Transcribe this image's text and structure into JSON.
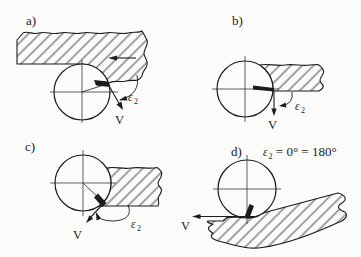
{
  "figure": {
    "colors": {
      "ink": "#1c1c1c",
      "background": "#fbfbf9"
    },
    "panels": {
      "a": {
        "label": "a)",
        "v_label": "V",
        "eps": "ε",
        "eps_sub": "2"
      },
      "b": {
        "label": "b)",
        "v_label": "V",
        "eps": "ε",
        "eps_sub": "2"
      },
      "c": {
        "label": "c)",
        "v_label": "V",
        "eps": "ε",
        "eps_sub": "2"
      },
      "d": {
        "label": "d)",
        "v_label": "V",
        "eq_eps": "ε",
        "eq_eps_sub": "2",
        "eq_rest": " = 0° = 180°"
      }
    }
  }
}
